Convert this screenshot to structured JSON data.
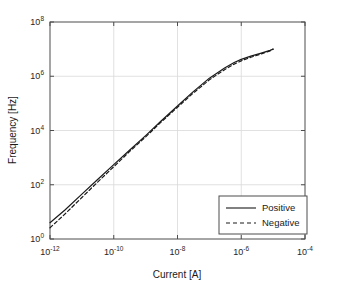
{
  "chart_data": {
    "type": "line",
    "title": "",
    "xlabel": "Current [A]",
    "ylabel": "Frequency [Hz]",
    "xscale": "log",
    "yscale": "log",
    "xlim": [
      1e-12,
      0.0001
    ],
    "ylim": [
      1,
      100000000.0
    ],
    "grid": true,
    "xticks": [
      1e-12,
      1e-10,
      1e-08,
      1e-06,
      0.0001
    ],
    "xtick_labels": [
      "10-12",
      "10-10",
      "10-8",
      "10-6",
      "10-4"
    ],
    "xtick_mantissa": [
      "10",
      "10",
      "10",
      "10",
      "10"
    ],
    "xtick_exponents": [
      "-12",
      "-10",
      "-8",
      "-6",
      "-4"
    ],
    "yticks": [
      1,
      100,
      10000,
      1000000,
      100000000
    ],
    "ytick_labels": [
      "100",
      "102",
      "104",
      "106",
      "108"
    ],
    "ytick_mantissa": [
      "10",
      "10",
      "10",
      "10",
      "10"
    ],
    "ytick_exponents": [
      "0",
      "2",
      "4",
      "6",
      "8"
    ],
    "legend_position": "lower right",
    "series": [
      {
        "name": "Positive",
        "style": "solid",
        "color": "#1a1a1a",
        "x": [
          1e-12,
          3e-12,
          1e-11,
          3e-11,
          1e-10,
          3e-10,
          1e-09,
          3e-09,
          1e-08,
          3e-08,
          1e-07,
          3e-07,
          6e-07,
          1e-06,
          2e-06,
          4e-06,
          8e-06,
          1e-05
        ],
        "y": [
          4.0,
          12.0,
          45.0,
          150.0,
          550.0,
          1800.0,
          6500.0,
          22000.0,
          80000.0,
          260000.0,
          850000.0,
          2000000.0,
          3200000.0,
          4200000.0,
          5500000.0,
          7000000.0,
          9000000.0,
          10000000.0
        ]
      },
      {
        "name": "Negative",
        "style": "dashed",
        "color": "#1a1a1a",
        "x": [
          1e-12,
          3e-12,
          1e-11,
          3e-11,
          1e-10,
          3e-10,
          1e-09,
          3e-09,
          1e-08,
          3e-08,
          1e-07,
          3e-07,
          6e-07,
          1e-06,
          2e-06,
          4e-06,
          8e-06,
          1e-05
        ],
        "y": [
          2.6,
          8.5,
          34.0,
          120.0,
          460.0,
          1600.0,
          5800.0,
          20000.0,
          72000.0,
          230000.0,
          740000.0,
          1750000.0,
          2800000.0,
          3700000.0,
          5000000.0,
          6500000.0,
          8600000.0,
          10000000.0
        ]
      }
    ]
  },
  "legend": {
    "items": [
      {
        "label": "Positive",
        "style": "solid"
      },
      {
        "label": "Negative",
        "style": "dashed"
      }
    ]
  },
  "colors": {
    "axis": "#4d4d4d",
    "grid": "#d9d9d9",
    "line": "#1a1a1a",
    "background": "#ffffff",
    "text": "#1a1a1a"
  }
}
